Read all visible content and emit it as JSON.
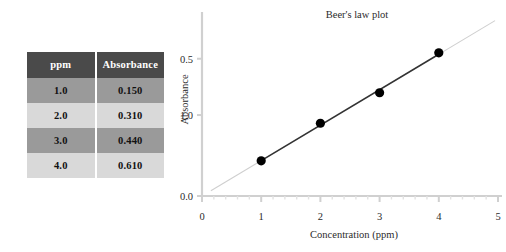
{
  "table": {
    "name": "absorbance-data-table",
    "columns": [
      "ppm",
      "Absorbance"
    ],
    "rows": [
      {
        "ppm": "1.0",
        "absorbance": "0.150"
      },
      {
        "ppm": "2.0",
        "absorbance": "0.310"
      },
      {
        "ppm": "3.0",
        "absorbance": "0.440"
      },
      {
        "ppm": "4.0",
        "absorbance": "0.610"
      }
    ],
    "header_bg": "#4a4a4a",
    "header_fg": "#ffffff",
    "row_dark_bg": "#9a9a9a",
    "row_light_bg": "#d9d9d9"
  },
  "chart_data": {
    "type": "scatter",
    "title": "Beer's law plot",
    "xlabel": "Concentration (ppm)",
    "ylabel": "Absorbance",
    "x": [
      1.0,
      2.0,
      3.0,
      4.0
    ],
    "y": [
      0.15,
      0.31,
      0.44,
      0.61
    ],
    "series": [
      {
        "name": "Absorbance vs concentration",
        "x": [
          1.0,
          2.0,
          3.0,
          4.0
        ],
        "values": [
          0.15,
          0.31,
          0.44,
          0.61
        ],
        "marker": "filled-circle",
        "marker_color": "#000000",
        "line": "trendline",
        "line_color": "#333333"
      }
    ],
    "xlim": [
      0,
      5
    ],
    "xticks": [
      "0",
      "1",
      "2",
      "3",
      "4",
      "5"
    ],
    "xtick_values": [
      0,
      1,
      2,
      3,
      4,
      5
    ],
    "x_minor_ticks": true,
    "ylim": [
      0,
      0.75
    ],
    "yticks": [
      "0.0",
      "1.0",
      "0.5"
    ],
    "ytick_values": [
      0.0,
      0.345,
      0.585
    ],
    "grid": false,
    "legend": "none",
    "axis_color": "#d0d0d0",
    "trendline_extends_beyond_points": true
  }
}
